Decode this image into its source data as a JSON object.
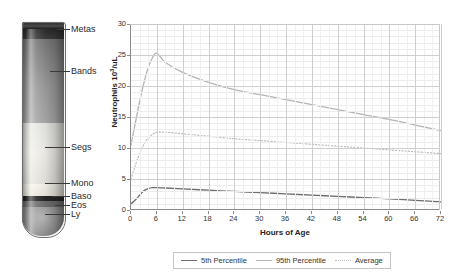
{
  "tube": {
    "title": "blood-cell-maturation-tube",
    "labels": [
      {
        "name": "metas",
        "text": "Metas"
      },
      {
        "name": "bands",
        "text": "Bands"
      },
      {
        "name": "segs",
        "text": "Segs"
      },
      {
        "name": "mono",
        "text": "Mono"
      },
      {
        "name": "baso",
        "text": "Baso"
      },
      {
        "name": "eos",
        "text": "Eos"
      },
      {
        "name": "ly",
        "text": "Ly"
      }
    ],
    "colors": {
      "metas": "#3a3a3a",
      "bands": "#8d8d8d",
      "segs": "#e2e2de",
      "mono": "#f3f0e8",
      "baso": "#2e2e2e",
      "eos": "#9a9a9a",
      "ly": "#8a8a8a",
      "rim": "#2b2b2b",
      "outline": "#6f6f6f"
    }
  },
  "chart_data": {
    "type": "line",
    "title": "",
    "xlabel": "Hours of Age",
    "ylabel": "Neutrophils 10³/uL",
    "xlim": [
      0,
      72
    ],
    "ylim": [
      0,
      30
    ],
    "xticks": [
      0,
      6,
      12,
      18,
      24,
      30,
      36,
      42,
      48,
      54,
      60,
      66,
      72
    ],
    "yticks": [
      0,
      5,
      10,
      15,
      20,
      25,
      30
    ],
    "grid": true,
    "legend_position": "bottom",
    "series": [
      {
        "name": "5th Percentile",
        "color": "#6e6e6e",
        "style": "solid",
        "x": [
          0,
          1,
          2,
          3,
          4,
          5,
          6,
          8,
          12,
          18,
          24,
          30,
          36,
          42,
          48,
          54,
          60,
          66,
          72
        ],
        "values": [
          1.0,
          1.6,
          2.4,
          3.1,
          3.45,
          3.6,
          3.6,
          3.55,
          3.4,
          3.2,
          3.0,
          2.8,
          2.6,
          2.4,
          2.2,
          2.0,
          1.8,
          1.55,
          1.3
        ]
      },
      {
        "name": "95th Percentile",
        "color": "#b4b4b4",
        "style": "solid",
        "x": [
          0,
          1,
          2,
          3,
          4,
          5,
          6,
          8,
          12,
          18,
          24,
          30,
          36,
          42,
          48,
          54,
          60,
          66,
          72
        ],
        "values": [
          10.5,
          14.0,
          17.5,
          20.5,
          23.0,
          24.6,
          25.3,
          23.8,
          22.2,
          20.6,
          19.4,
          18.6,
          17.8,
          17.0,
          16.2,
          15.4,
          14.6,
          13.7,
          12.8
        ]
      },
      {
        "name": "Average",
        "color": "#bdbdbd",
        "style": "dotted",
        "x": [
          0,
          1,
          2,
          3,
          4,
          5,
          6,
          8,
          12,
          18,
          24,
          30,
          36,
          42,
          48,
          54,
          60,
          66,
          72
        ],
        "values": [
          5.0,
          7.2,
          9.1,
          10.6,
          11.6,
          12.2,
          12.5,
          12.55,
          12.3,
          11.9,
          11.5,
          11.2,
          10.9,
          10.6,
          10.3,
          10.0,
          9.7,
          9.4,
          9.1
        ]
      }
    ]
  },
  "legend": {
    "items": [
      {
        "label": "5th Percentile"
      },
      {
        "label": "95th Percentile"
      },
      {
        "label": "Average"
      }
    ]
  }
}
